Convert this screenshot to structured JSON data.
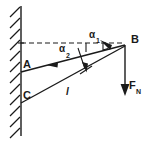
{
  "figure": {
    "type": "physics-free-body-diagram",
    "background_color": "#ffffff",
    "ink_color": "#1a1a1a"
  },
  "labels": {
    "point_a": "A",
    "point_b": "B",
    "point_c": "C",
    "angle_1": "α",
    "angle_1_sub": "1",
    "angle_2": "α",
    "angle_2_sub": "2",
    "force": "F",
    "force_sub": "N",
    "length": "l"
  },
  "geometry": {
    "wall_x": 21,
    "wall_top_y": 6,
    "wall_bottom_y": 136,
    "point_a": {
      "x": 21,
      "y": 72
    },
    "point_b": {
      "x": 125,
      "y": 45
    },
    "point_c": {
      "x": 21,
      "y": 103
    },
    "dashed_line": {
      "x1": 21,
      "y1": 43,
      "x2": 124,
      "y2": 43
    },
    "force_arrow": {
      "x1": 125,
      "y1": 45,
      "x2": 125,
      "y2": 95
    }
  },
  "elements": {
    "wall_name": "hatched-wall",
    "cable_ab_name": "cable-a-b",
    "cable_cb_name": "cable-c-b",
    "dashed_name": "horizontal-reference-dashed-line",
    "force_name": "force-vector-fn"
  }
}
